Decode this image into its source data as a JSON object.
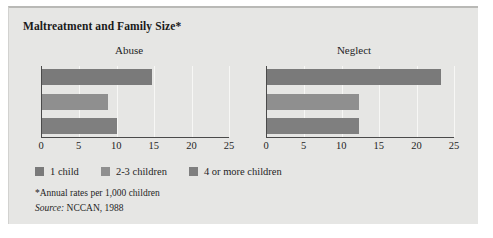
{
  "figure": {
    "background": "#e6e6e4",
    "title": "Maltreatment and Family Size*",
    "footnote": "*Annual rates per 1,000 children",
    "source_word": "Source:",
    "source_text": " NCCAN, 1988"
  },
  "legend": {
    "items": [
      {
        "label": "1 child",
        "color": "#7a7a7a"
      },
      {
        "label": "2-3 children",
        "color": "#8f8f8f"
      },
      {
        "label": "4 or more children",
        "color": "#7f7f7f"
      }
    ]
  },
  "chart_data": {
    "type": "bar",
    "orientation": "horizontal",
    "title": "Maltreatment and Family Size*",
    "subtitle": "",
    "xlabel": "",
    "ylabel": "",
    "xlim": [
      0,
      25
    ],
    "ticks": [
      0,
      5,
      10,
      15,
      20,
      25
    ],
    "tick_labels": [
      "0",
      "5",
      "10",
      "15",
      "20",
      "25"
    ],
    "grid": true,
    "legend_position": "bottom-left",
    "annotation": "*Annual rates per 1,000 children",
    "source": "Source: NCCAN, 1988",
    "units": "annual rates per 1,000 children",
    "categories": [
      "1 child",
      "2-3 children",
      "4 or more children"
    ],
    "panels": [
      {
        "name": "Abuse",
        "values": [
          14.7,
          8.8,
          10.0
        ]
      },
      {
        "name": "Neglect",
        "values": [
          23.2,
          12.3,
          12.3
        ]
      }
    ]
  }
}
